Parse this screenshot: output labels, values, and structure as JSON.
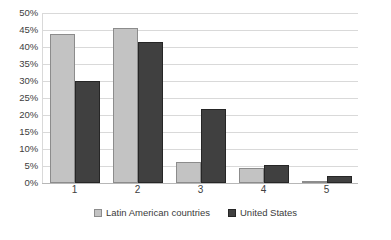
{
  "chart_data": {
    "type": "bar",
    "title": "",
    "subtitle": "",
    "xlabel": "",
    "ylabel": "",
    "categories": [
      "1",
      "2",
      "3",
      "4",
      "5"
    ],
    "series": [
      {
        "name": "Latin American countries",
        "color": "#c3c3c3",
        "values": [
          43.8,
          45.5,
          6.3,
          4.4,
          0.5
        ]
      },
      {
        "name": "United States",
        "color": "#404040",
        "values": [
          30.0,
          41.6,
          21.8,
          5.4,
          2.0
        ]
      }
    ],
    "ylim": [
      0,
      50
    ],
    "ytick_step": 5,
    "ytick_labels": [
      "0%",
      "5%",
      "10%",
      "15%",
      "20%",
      "25%",
      "30%",
      "35%",
      "40%",
      "45%",
      "50%"
    ],
    "grid": true,
    "grid_axis": "y",
    "legend_position": "bottom"
  },
  "axes": {
    "y_ticks": [
      {
        "label": "50%",
        "value": 50
      },
      {
        "label": "45%",
        "value": 45
      },
      {
        "label": "40%",
        "value": 40
      },
      {
        "label": "35%",
        "value": 35
      },
      {
        "label": "30%",
        "value": 30
      },
      {
        "label": "25%",
        "value": 25
      },
      {
        "label": "20%",
        "value": 20
      },
      {
        "label": "15%",
        "value": 15
      },
      {
        "label": "10%",
        "value": 10
      },
      {
        "label": "5%",
        "value": 5
      },
      {
        "label": "0%",
        "value": 0
      }
    ],
    "x_ticks": [
      "1",
      "2",
      "3",
      "4",
      "5"
    ]
  },
  "legend": {
    "items": [
      {
        "label": "Latin American countries",
        "color": "#c3c3c3"
      },
      {
        "label": "United States",
        "color": "#404040"
      }
    ]
  },
  "colors": {
    "series_a": "#c3c3c3",
    "series_b": "#404040",
    "gridline": "#d9d9d9",
    "text": "#404040",
    "background": "#ffffff"
  }
}
